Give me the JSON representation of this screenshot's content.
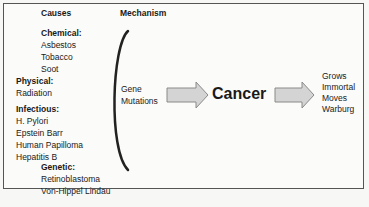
{
  "headers": {
    "causes": "Causes",
    "mechanism": "Mechanism"
  },
  "causes": {
    "chemical": {
      "label": "Chemical:",
      "items": [
        "Asbestos",
        "Tobacco",
        "Soot"
      ]
    },
    "physical": {
      "label": "Physical:",
      "items": [
        "Radiation"
      ]
    },
    "infectious": {
      "label": "Infectious:",
      "items": [
        "H. Pylori",
        "Epstein Barr",
        "Human Papilloma",
        "Hepatitis B"
      ]
    },
    "genetic": {
      "label": "Genetic:",
      "items": [
        "Retinoblastoma",
        "Von-Hippel Lindau"
      ]
    }
  },
  "mechanism": {
    "line1": "Gene",
    "line2": "Mutations"
  },
  "center": {
    "label": "Cancer"
  },
  "outcomes": [
    "Grows",
    "Immortal",
    "Moves",
    "Warburg"
  ],
  "colors": {
    "arrow_fill": "#d4d4d4",
    "arrow_stroke": "#8a8a8a",
    "bracket": "#222222"
  }
}
